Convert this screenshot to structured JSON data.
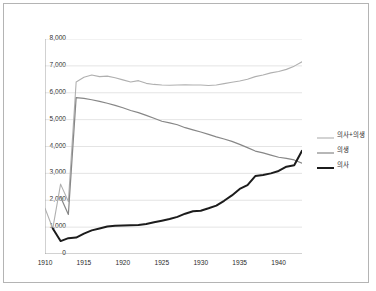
{
  "chart_data": {
    "type": "line",
    "title": "",
    "xlabel": "",
    "ylabel": "",
    "xlim": [
      1910,
      1943
    ],
    "ylim": [
      0,
      8000
    ],
    "ytick_step": 1000,
    "grid": "horizontal",
    "legend_position": "right",
    "ytick_labels": [
      "8,000",
      "7,000",
      "6,000",
      "5,000",
      "4,000",
      "3,000",
      "2,000",
      "1,000",
      "0"
    ],
    "ytick_values": [
      8000,
      7000,
      6000,
      5000,
      4000,
      3000,
      2000,
      1000,
      0
    ],
    "xtick_labels": [
      "1910",
      "1915",
      "1920",
      "1925",
      "1930",
      "1935",
      "1940"
    ],
    "xtick_values": [
      1910,
      1915,
      1920,
      1925,
      1930,
      1935,
      1940
    ],
    "x": [
      1910,
      1911,
      1912,
      1913,
      1914,
      1915,
      1916,
      1917,
      1918,
      1919,
      1920,
      1921,
      1922,
      1923,
      1924,
      1925,
      1926,
      1927,
      1928,
      1929,
      1930,
      1931,
      1932,
      1933,
      1934,
      1935,
      1936,
      1937,
      1938,
      1939,
      1940,
      1941,
      1942,
      1943
    ],
    "series": [
      {
        "name": "의사+의생",
        "color": "#b0b0b0",
        "width": 1.1,
        "values": [
          1700,
          950,
          2600,
          1950,
          6400,
          6580,
          6660,
          6600,
          6620,
          6560,
          6480,
          6400,
          6450,
          6350,
          6310,
          6290,
          6280,
          6290,
          6300,
          6290,
          6290,
          6270,
          6290,
          6340,
          6390,
          6440,
          6500,
          6600,
          6660,
          6740,
          6790,
          6870,
          6990,
          7150
        ]
      },
      {
        "name": "의생",
        "color": "#878787",
        "width": 1.2,
        "values": [
          null,
          null,
          2120,
          1470,
          5820,
          5790,
          5740,
          5680,
          5610,
          5530,
          5440,
          5340,
          5260,
          5160,
          5050,
          4940,
          4880,
          4810,
          4700,
          4620,
          4540,
          4450,
          4360,
          4280,
          4190,
          4080,
          3960,
          3830,
          3760,
          3680,
          3600,
          3560,
          3500,
          3380
        ]
      },
      {
        "name": "의사",
        "color": "#1c1c1c",
        "width": 2.0,
        "values": [
          null,
          950,
          480,
          590,
          610,
          760,
          880,
          950,
          1020,
          1050,
          1060,
          1070,
          1080,
          1120,
          1180,
          1240,
          1300,
          1380,
          1500,
          1590,
          1610,
          1700,
          1800,
          1980,
          2180,
          2420,
          2560,
          2900,
          2940,
          3000,
          3090,
          3250,
          3300,
          3840
        ]
      }
    ]
  },
  "legend": {
    "items": [
      {
        "label": "의사+의생"
      },
      {
        "label": "의생"
      },
      {
        "label": "의사"
      }
    ]
  }
}
